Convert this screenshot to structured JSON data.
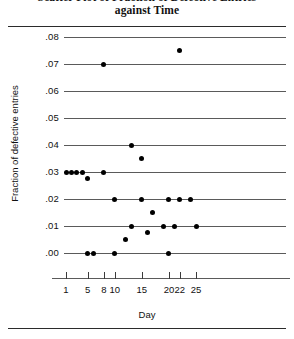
{
  "figure": {
    "title_lines": [
      "Scatter Plot of Fraction of Defective Entries",
      "against Time"
    ]
  },
  "chart_data": {
    "type": "scatter",
    "title": "Scatter Plot of Fraction of Defective Entries against Time",
    "xlabel": "Day",
    "ylabel": "Fraction of defective entries",
    "xlim": [
      0,
      27
    ],
    "ylim": [
      0.0,
      0.08
    ],
    "grid": true,
    "legend": null,
    "xticks": [
      1,
      5,
      8,
      10,
      15,
      20,
      22,
      25
    ],
    "xtick_labels": [
      "1",
      "5",
      "8",
      "10",
      "15",
      "20",
      "22",
      "25"
    ],
    "yticks": [
      0.0,
      0.01,
      0.02,
      0.03,
      0.04,
      0.05,
      0.06,
      0.07,
      0.08
    ],
    "ytick_labels": [
      ".00",
      ".01",
      ".02",
      ".03",
      ".04",
      ".05",
      ".06",
      ".07",
      ".08"
    ],
    "points": [
      {
        "x": 1,
        "y": 0.03
      },
      {
        "x": 2,
        "y": 0.03
      },
      {
        "x": 3,
        "y": 0.03
      },
      {
        "x": 4,
        "y": 0.03
      },
      {
        "x": 5,
        "y": 0.0275
      },
      {
        "x": 5,
        "y": 0.0
      },
      {
        "x": 6,
        "y": 0.0
      },
      {
        "x": 8,
        "y": 0.03
      },
      {
        "x": 8,
        "y": 0.07
      },
      {
        "x": 10,
        "y": 0.02
      },
      {
        "x": 10,
        "y": 0.0
      },
      {
        "x": 12,
        "y": 0.005
      },
      {
        "x": 13,
        "y": 0.04
      },
      {
        "x": 13,
        "y": 0.01
      },
      {
        "x": 15,
        "y": 0.02
      },
      {
        "x": 15,
        "y": 0.035
      },
      {
        "x": 16,
        "y": 0.0075
      },
      {
        "x": 17,
        "y": 0.015
      },
      {
        "x": 19,
        "y": 0.01
      },
      {
        "x": 20,
        "y": 0.02
      },
      {
        "x": 20,
        "y": 0.0
      },
      {
        "x": 21,
        "y": 0.01
      },
      {
        "x": 22,
        "y": 0.02
      },
      {
        "x": 22,
        "y": 0.075
      },
      {
        "x": 24,
        "y": 0.02
      },
      {
        "x": 25,
        "y": 0.01
      }
    ]
  }
}
